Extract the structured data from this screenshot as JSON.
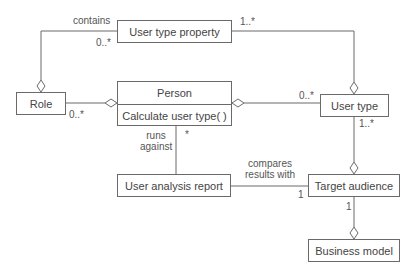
{
  "diagram": {
    "type": "UML class diagram",
    "classes": {
      "user_type_property": {
        "name": "User type property"
      },
      "role": {
        "name": "Role"
      },
      "person": {
        "name": "Person",
        "operations": [
          "Calculate user type( )"
        ]
      },
      "user_type": {
        "name": "User type"
      },
      "user_analysis_report": {
        "name": "User analysis report"
      },
      "target_audience": {
        "name": "Target audience"
      },
      "business_model": {
        "name": "Business model"
      }
    },
    "associations": {
      "role_property": {
        "label": "contains",
        "mult_property": "0..*",
        "mult_usertype": "1..*"
      },
      "role_person": {
        "mult_role": "0..*"
      },
      "person_usertype": {
        "mult_usertype": "0..*"
      },
      "usertype_target": {
        "mult_usertype": "1..*"
      },
      "person_report": {
        "label_line1": "runs",
        "label_line2": "against",
        "mult_person": "*"
      },
      "report_target": {
        "label_line1": "compares",
        "label_line2": "results with",
        "mult_target": "1"
      },
      "target_business": {
        "mult_target": "1"
      }
    },
    "colors": {
      "line": "#6a6a6a",
      "text": "#444444",
      "background": "#ffffff"
    }
  }
}
